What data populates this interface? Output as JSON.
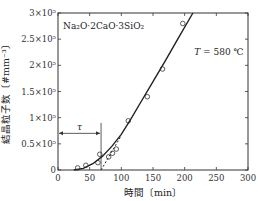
{
  "chart_data": {
    "type": "scatter",
    "title": "",
    "xlabel": "時間〔min〕",
    "ylabel": "結晶粒子数〔#mm⁻³〕",
    "xlim": [
      0,
      300
    ],
    "ylim": [
      0,
      300000
    ],
    "x_ticks": [
      0,
      50,
      100,
      150,
      200,
      250,
      300
    ],
    "x_tick_labels": [
      "0",
      "50",
      "100",
      "150",
      "200",
      "250",
      "300"
    ],
    "y_ticks": [
      0,
      50000,
      100000,
      150000,
      200000,
      250000,
      300000
    ],
    "y_tick_labels": [
      "0",
      "0.5×10⁵",
      "1×10⁵",
      "1.5×10⁵",
      "2×10⁵",
      "2.5×10⁵",
      "3×10⁵"
    ],
    "grid": false,
    "annotations": [
      {
        "text": "Na₂O·2CaO·3SiO₂",
        "x": 8,
        "y": 270000
      },
      {
        "text": "T = 580 ℃",
        "x": 215,
        "y": 220000
      },
      {
        "text": "τ",
        "x": 34,
        "y": 70000
      }
    ],
    "tau": 68,
    "series": [
      {
        "name": "measured",
        "marker": "open-circle",
        "x": [
          31,
          44,
          63,
          66,
          80,
          86,
          92,
          111,
          141,
          165,
          197
        ],
        "y": [
          4000,
          9000,
          14000,
          30000,
          25000,
          32000,
          40000,
          94000,
          140000,
          193000,
          280000
        ]
      },
      {
        "name": "fit-curve",
        "style": "solid",
        "x": [
          25,
          40,
          55,
          70,
          85,
          100,
          115,
          130,
          150,
          170,
          190,
          213
        ],
        "y": [
          0,
          3000,
          12000,
          26000,
          45000,
          68000,
          97000,
          128000,
          169000,
          210000,
          252000,
          300000
        ]
      },
      {
        "name": "linear-extrapolation",
        "style": "dashed",
        "x": [
          68,
          100
        ],
        "y": [
          0,
          66000
        ]
      }
    ]
  }
}
